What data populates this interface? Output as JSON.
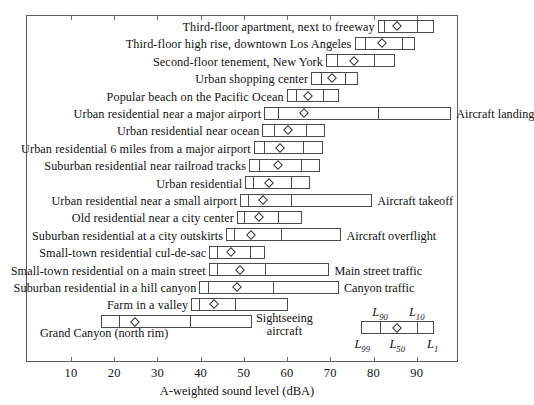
{
  "chart_data": {
    "type": "bar",
    "subtype": "box-percentile",
    "title": "",
    "xlabel": "A-weighted sound level (dBA)",
    "ylabel": "",
    "xlim": [
      3.8,
      99.5
    ],
    "xticks": [
      10,
      20,
      30,
      40,
      50,
      60,
      70,
      80,
      90
    ],
    "grid": false,
    "legend_position": "inside-bottom-right",
    "stat_labels": [
      "L90",
      "L10",
      "L99",
      "L50",
      "L1"
    ],
    "legend": {
      "L99": 77,
      "L90": 81.5,
      "L50": 85.5,
      "L10": 90,
      "L1": 94,
      "top_left_label": "L90",
      "top_right_label": "L10",
      "bottom_left_label": "L99",
      "bottom_mid_label": "L50",
      "bottom_right_label": "L1"
    },
    "categories": [
      "Third-floor apartment, next to freeway",
      "Third-floor high rise, downtown Los Angeles",
      "Second-floor tenement, New York",
      "Urban shopping center",
      "Popular beach on the Pacific Ocean",
      "Urban residential near a major airport",
      "Urban residential near ocean",
      "Urban residential 6 miles from a major airport",
      "Suburban residential near railroad tracks",
      "Urban residential",
      "Urban residential near a small airport",
      "Old residential near a city center",
      "Suburban residential at a city outskirts",
      "Small-town residential cul-de-sac",
      "Small-town residential on a main street",
      "Suburban residential in a hill canyon",
      "Farm in a valley",
      "Grand Canyon (north rim)"
    ],
    "rows": [
      {
        "label": "Third-floor apartment, next to freeway",
        "L99": 81.0,
        "L90": 82.5,
        "L50": 85.5,
        "L10": 90.0,
        "L1": 94.0,
        "note": ""
      },
      {
        "label": "Third-floor high rise, downtown Los Angeles",
        "L99": 75.6,
        "L90": 78.0,
        "L50": 82.0,
        "L10": 86.6,
        "L1": 89.5,
        "note": ""
      },
      {
        "label": "Second-floor tenement, New York",
        "L99": 69.0,
        "L90": 71.5,
        "L50": 75.5,
        "L10": 80.0,
        "L1": 85.0,
        "note": ""
      },
      {
        "label": "Urban shopping center",
        "L99": 65.6,
        "L90": 67.8,
        "L50": 70.5,
        "L10": 73.4,
        "L1": 76.4,
        "note": ""
      },
      {
        "label": "Popular beach on the Pacific Ocean",
        "L99": 59.9,
        "L90": 62.0,
        "L50": 64.9,
        "L10": 68.3,
        "L1": 72.0,
        "note": ""
      },
      {
        "label": "Urban residential near a major airport",
        "L99": 54.7,
        "L90": 58.0,
        "L50": 63.9,
        "L10": 81.0,
        "L1": 98.0,
        "note": "Aircraft landing"
      },
      {
        "label": "Urban residential near ocean",
        "L99": 54.3,
        "L90": 56.9,
        "L50": 60.3,
        "L10": 64.4,
        "L1": 68.8,
        "note": ""
      },
      {
        "label": "Urban residential 6 miles from a major airport",
        "L99": 52.3,
        "L90": 54.6,
        "L50": 58.4,
        "L10": 63.7,
        "L1": 68.3,
        "note": ""
      },
      {
        "label": "Suburban residential near railroad tracks",
        "L99": 51.2,
        "L90": 53.6,
        "L50": 58.0,
        "L10": 63.3,
        "L1": 67.7,
        "note": ""
      },
      {
        "label": "Urban residential",
        "L99": 50.3,
        "L90": 52.2,
        "L50": 55.8,
        "L10": 60.8,
        "L1": 65.4,
        "note": ""
      },
      {
        "label": "Urban residential near a small airport",
        "L99": 49.1,
        "L90": 50.9,
        "L50": 54.4,
        "L10": 61.0,
        "L1": 79.7,
        "note": "Aircraft takeoff"
      },
      {
        "label": "Old residential near a city center",
        "L99": 48.4,
        "L90": 50.0,
        "L50": 53.4,
        "L10": 58.0,
        "L1": 63.4,
        "note": ""
      },
      {
        "label": "Suburban residential at a city outskirts",
        "L99": 45.9,
        "L90": 47.7,
        "L50": 51.6,
        "L10": 58.6,
        "L1": 72.6,
        "note": "Aircraft overflight"
      },
      {
        "label": "Small-town residential cul-de-sac",
        "L99": 42.0,
        "L90": 43.7,
        "L50": 47.0,
        "L10": 51.3,
        "L1": 55.0,
        "note": ""
      },
      {
        "label": "Small-town residential on a main street",
        "L99": 41.9,
        "L90": 43.8,
        "L50": 49.2,
        "L10": 55.0,
        "L1": 69.8,
        "note": "Main street traffic"
      },
      {
        "label": "Suburban residential in a hill canyon",
        "L99": 39.7,
        "L90": 41.7,
        "L50": 48.5,
        "L10": 56.8,
        "L1": 72.0,
        "note": "Canyon traffic"
      },
      {
        "label": "Farm in a valley",
        "L99": 37.8,
        "L90": 39.6,
        "L50": 43.0,
        "L10": 48.0,
        "L1": 60.3,
        "note": ""
      },
      {
        "label": "Grand Canyon (north rim)",
        "L99": 16.9,
        "L90": 21.1,
        "L50": 24.8,
        "L10": 37.5,
        "L1": 51.8,
        "note": "Sightseeing aircraft"
      }
    ]
  },
  "annotations": {
    "aircraft_landing": "Aircraft landing",
    "aircraft_takeoff": "Aircraft takeoff",
    "aircraft_overflight": "Aircraft overflight",
    "main_street_traffic": "Main street traffic",
    "canyon_traffic": "Canyon traffic",
    "sightseeing_line1": "Sightseeing",
    "sightseeing_line2": "aircraft",
    "grand_canyon_label": "Grand Canyon (north rim)"
  },
  "axis": {
    "title": "A-weighted sound level (dBA)",
    "tick_labels": [
      "10",
      "20",
      "30",
      "40",
      "50",
      "60",
      "70",
      "80",
      "90"
    ]
  },
  "colors": {
    "frame": "#5c5c5c",
    "box_stroke": "#4a4a4a",
    "text": "#111111",
    "background": "#ffffff"
  }
}
